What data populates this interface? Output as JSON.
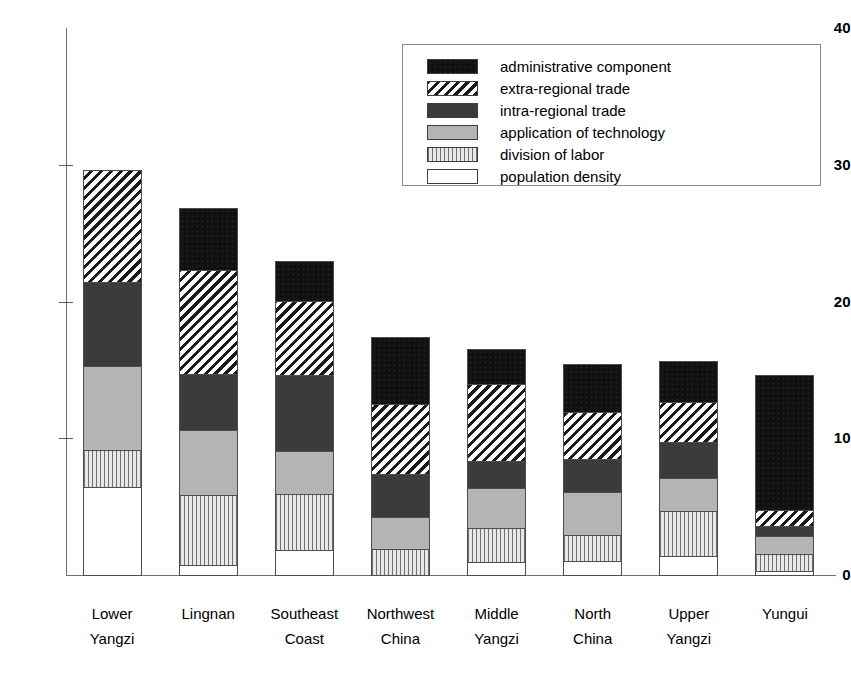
{
  "chart_data": {
    "type": "bar",
    "subtype": "stacked-vertical",
    "title": "",
    "subtitle": "",
    "xlabel": "",
    "ylabel": "",
    "ylim": [
      0,
      40
    ],
    "ytick_labels": [
      "0",
      "10",
      "20",
      "30",
      "40"
    ],
    "ytick_values": [
      0,
      10,
      20,
      30,
      40
    ],
    "grid": false,
    "legend_position": "top-right-inside",
    "categories": [
      "Lower Yangzi",
      "Lingnan",
      "Southeast Coast",
      "Northwest China",
      "Middle Yangzi",
      "North China",
      "Upper Yangzi",
      "Yungui"
    ],
    "category_lines": [
      [
        "Lower",
        "Yangzi"
      ],
      [
        "Lingnan",
        ""
      ],
      [
        "Southeast",
        "Coast"
      ],
      [
        "Northwest",
        "China"
      ],
      [
        "Middle",
        "Yangzi"
      ],
      [
        "North",
        "China"
      ],
      [
        "Upper",
        "Yangzi"
      ],
      [
        "Yungui",
        ""
      ]
    ],
    "stack_order_bottom_to_top": [
      "population density",
      "division of labor",
      "application of technology",
      "intra-regional trade",
      "extra-regional trade",
      "administrative component"
    ],
    "series": [
      {
        "name": "population density",
        "pattern": "white-solid",
        "color": "#ffffff",
        "values": [
          6.5,
          0.8,
          1.9,
          0.0,
          1.0,
          1.1,
          1.5,
          0.4
        ]
      },
      {
        "name": "division of labor",
        "pattern": "vertical-lines",
        "color": "#e8e8e8",
        "values": [
          2.8,
          5.2,
          4.2,
          2.0,
          2.6,
          2.0,
          3.3,
          1.3
        ]
      },
      {
        "name": "application of technology",
        "pattern": "light-gray-solid",
        "color": "#b4b4b4",
        "values": [
          6.2,
          4.8,
          3.2,
          2.4,
          3.0,
          3.2,
          2.5,
          1.4
        ]
      },
      {
        "name": "intra-regional trade",
        "pattern": "dark-gray-stipple",
        "color": "#3b3b3b",
        "values": [
          6.2,
          4.2,
          5.6,
          3.2,
          2.0,
          2.5,
          2.7,
          0.8
        ]
      },
      {
        "name": "extra-regional trade",
        "pattern": "diagonal-hatch",
        "color": "#1a1a1a",
        "values": [
          8.3,
          7.7,
          5.5,
          5.2,
          5.7,
          3.5,
          3.0,
          1.2
        ]
      },
      {
        "name": "administrative component",
        "pattern": "black-solid",
        "color": "#121212",
        "values": [
          0.0,
          4.6,
          3.0,
          5.0,
          2.7,
          3.6,
          3.1,
          10.0
        ]
      }
    ],
    "totals": [
      30.0,
      27.3,
      23.4,
      17.8,
      17.0,
      15.9,
      16.1,
      15.1
    ]
  },
  "legend": {
    "items": [
      {
        "label": "administrative component",
        "swatch": "black-solid"
      },
      {
        "label": "extra-regional trade",
        "swatch": "diagonal-hatch"
      },
      {
        "label": "intra-regional trade",
        "swatch": "dark-gray-stipple"
      },
      {
        "label": "application of technology",
        "swatch": "light-gray-solid"
      },
      {
        "label": "division of labor",
        "swatch": "vertical-lines"
      },
      {
        "label": "population density",
        "swatch": "white-solid"
      }
    ]
  }
}
